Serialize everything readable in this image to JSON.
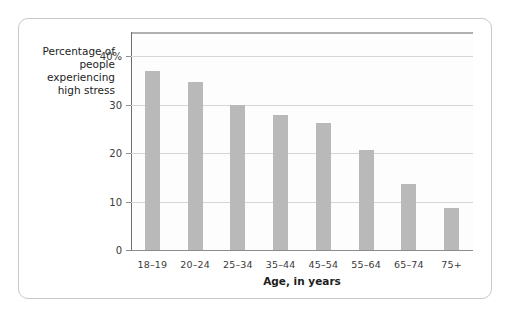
{
  "figure": {
    "background_color": "#ffffff",
    "border_color": "#c9c9c9"
  },
  "chart_data": {
    "type": "bar",
    "title": "",
    "subtitle": "",
    "xlabel": "Age, in years",
    "ylabel": "Percentage of people experiencing high stress",
    "ylabel_lines": [
      "Percentage of",
      "people",
      "experiencing",
      "high stress"
    ],
    "categories": [
      "18–19",
      "20–24",
      "25–34",
      "35–44",
      "45–54",
      "55–64",
      "65–74",
      "75+"
    ],
    "values": [
      37.0,
      34.7,
      29.9,
      27.8,
      26.3,
      20.7,
      13.7,
      8.6
    ],
    "ylim": [
      0,
      45
    ],
    "yticks": [
      0,
      10,
      20,
      30,
      40
    ],
    "ytick_labels": [
      "0",
      "10",
      "20",
      "30",
      "40%"
    ],
    "grid": true,
    "grid_axis": "y",
    "legend": false,
    "bar_color": "#b9b9b9",
    "gridline_color": "#d6d6d6",
    "axis_color": "#6e6e6e"
  }
}
